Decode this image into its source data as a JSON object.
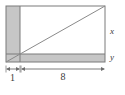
{
  "figure": {
    "type": "geometry-diagram",
    "colors": {
      "shaded_fill": "#c6c6c6",
      "stroke": "#7a7a7a",
      "diagonal_stroke": "#8a8a8a",
      "dimension_stroke": "#6e6e6e",
      "text": "#3a3a3a",
      "background": "#ffffff"
    },
    "labels": {
      "height_right": "x",
      "height_bottom_strip": "y",
      "width_left_strip": "1",
      "width_inner": "8"
    },
    "geometry": {
      "outer_rect": {
        "x": 6,
        "y": 6,
        "width": 99,
        "height": 56
      },
      "left_strip": {
        "x": 6,
        "y": 6,
        "width": 14,
        "height": 56
      },
      "bottom_strip": {
        "x": 6,
        "y": 54,
        "width": 99,
        "height": 8
      },
      "diagonal": {
        "x1": 6,
        "y1": 62,
        "x2": 105,
        "y2": 6
      },
      "inner_corner": {
        "x": 20,
        "y": 54
      }
    },
    "dimensions": [
      {
        "name": "left-strip-width",
        "label": "1",
        "from_x": 6,
        "to_x": 20,
        "y": 69
      },
      {
        "name": "inner-width",
        "label": "8",
        "from_x": 21,
        "to_x": 105,
        "y": 69
      }
    ]
  }
}
